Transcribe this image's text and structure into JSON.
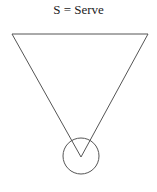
{
  "diagram": {
    "caption": "S = Serve",
    "symbol": "serve",
    "shapes": [
      "inverted-triangle",
      "circle-at-apex"
    ],
    "stroke_color": "#555555",
    "background_color": "#ffffff"
  }
}
